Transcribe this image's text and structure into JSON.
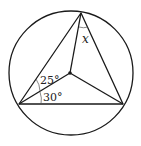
{
  "diagram": {
    "type": "geometry",
    "labels": {
      "angle_top": "x",
      "angle_upper_left": "25°",
      "angle_lower_left": "30°"
    },
    "colors": {
      "stroke": "#1a1a1a",
      "background": "#ffffff"
    }
  }
}
